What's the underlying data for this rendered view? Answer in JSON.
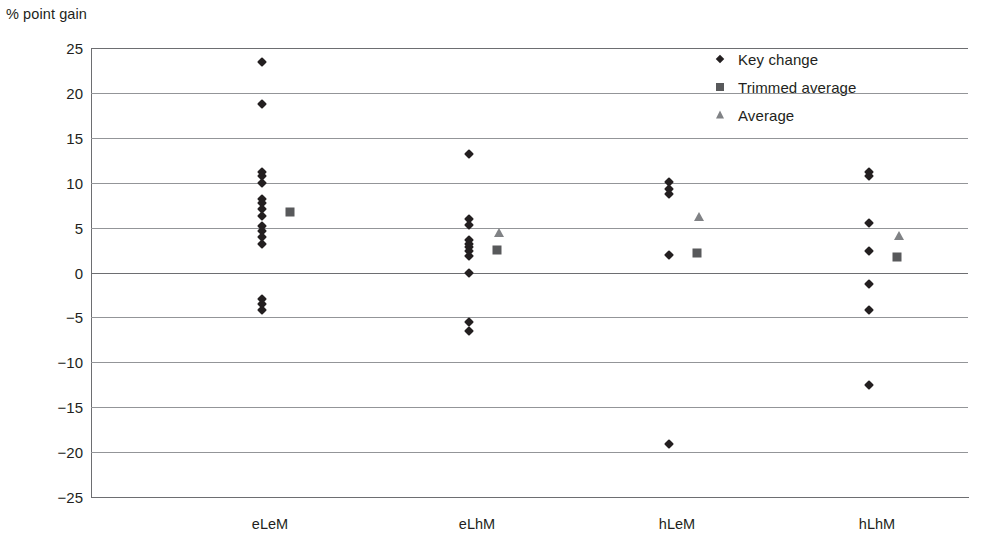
{
  "chart_data": {
    "type": "scatter",
    "title": "",
    "subtitle": "",
    "ylabel": "% point gain",
    "xlabel": "",
    "ylim": [
      -25,
      25
    ],
    "ytick_step": 5,
    "yticks": [
      25,
      20,
      15,
      10,
      5,
      0,
      -5,
      -10,
      -15,
      -20,
      -25
    ],
    "ytick_labels": [
      "25",
      "20",
      "15",
      "10",
      "5",
      "0",
      "−5",
      "−10",
      "−15",
      "−20",
      "−25"
    ],
    "categories": [
      "eLeM",
      "eLhM",
      "hLeM",
      "hLhM"
    ],
    "grid": true,
    "legend_position": "top-right",
    "legend": [
      {
        "label": "Key change",
        "marker": "diamond",
        "color": "#231f20"
      },
      {
        "label": "Trimmed average",
        "marker": "square",
        "color": "#58595b"
      },
      {
        "label": "Average",
        "marker": "triangle",
        "color": "#808285"
      }
    ],
    "series": [
      {
        "name": "Key change",
        "marker": "diamond",
        "groups": [
          {
            "category": "eLeM",
            "values": [
              23.4,
              18.8,
              11.2,
              10.7,
              10.0,
              8.2,
              7.7,
              7.1,
              6.3,
              5.2,
              4.6,
              3.9,
              3.2,
              -2.9,
              -3.5,
              -4.2
            ]
          },
          {
            "category": "eLhM",
            "values": [
              13.2,
              6.0,
              5.3,
              3.6,
              3.2,
              2.8,
              2.4,
              1.8,
              0.0,
              -5.5,
              -6.5
            ]
          },
          {
            "category": "hLeM",
            "values": [
              10.1,
              9.3,
              8.7,
              1.9,
              -19.1
            ]
          },
          {
            "category": "hLhM",
            "values": [
              11.2,
              10.7,
              5.5,
              2.4,
              -1.3,
              -4.2,
              -12.5
            ]
          }
        ]
      },
      {
        "name": "Trimmed average",
        "marker": "square",
        "groups": [
          {
            "category": "eLeM",
            "values": [
              6.7
            ]
          },
          {
            "category": "eLhM",
            "values": [
              2.5
            ]
          },
          {
            "category": "hLeM",
            "values": [
              2.2
            ]
          },
          {
            "category": "hLhM",
            "values": [
              1.7
            ]
          }
        ]
      },
      {
        "name": "Average",
        "marker": "triangle",
        "groups": [
          {
            "category": "eLeM",
            "values": []
          },
          {
            "category": "eLhM",
            "values": [
              4.4
            ]
          },
          {
            "category": "hLeM",
            "values": [
              6.2
            ]
          },
          {
            "category": "hLhM",
            "values": [
              4.1
            ]
          }
        ]
      }
    ]
  },
  "layout": {
    "plot_left": 91,
    "plot_top": 48,
    "plot_width": 877,
    "plot_height": 449,
    "category_x": [
      270,
      477,
      677,
      877
    ],
    "marker_offset_key": -8,
    "marker_offset_trimmed": 20,
    "marker_offset_average": 22
  }
}
